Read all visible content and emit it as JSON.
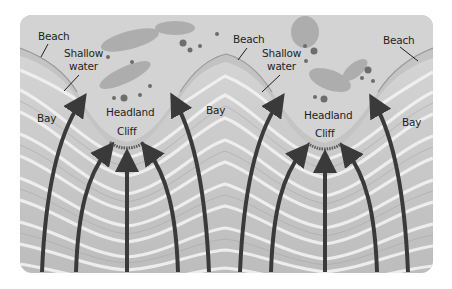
{
  "diagram": {
    "colors": {
      "background": "#ffffff",
      "water": "#c9c9c9",
      "wave_crest": "#eeeeee",
      "land": "#cfcfcf",
      "shallow_band": "#bdbdbd",
      "arrow": "#3a3a3a",
      "text": "#1f1f1f"
    },
    "labels": {
      "left": {
        "beach": "Beach",
        "shallow_water_1": "Shallow",
        "shallow_water_2": "water",
        "bay_left": "Bay",
        "headland": "Headland",
        "cliff": "Cliff",
        "bay_middle": "Bay"
      },
      "right": {
        "beach_left": "Beach",
        "shallow_water_1": "Shallow",
        "shallow_water_2": "water",
        "headland": "Headland",
        "cliff": "Cliff",
        "beach_right": "Beach",
        "bay_right": "Bay"
      }
    },
    "arrows": {
      "description": "Wave direction arrows converging on headlands",
      "count": 10
    }
  }
}
